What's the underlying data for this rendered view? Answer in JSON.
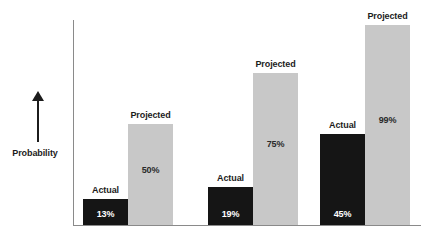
{
  "chart_data": {
    "type": "bar",
    "title": "",
    "subtitle": "",
    "xlabel": "",
    "ylabel": "Probability",
    "ylim": [
      0,
      100
    ],
    "grid": false,
    "legend": "none",
    "axis_ticks": [],
    "categories": [
      "Group 1",
      "Group 2",
      "Group 3"
    ],
    "series": [
      {
        "name": "Actual",
        "values": [
          13,
          19,
          45
        ]
      },
      {
        "name": "Projected",
        "values": [
          50,
          75,
          99
        ]
      }
    ],
    "bars": [
      {
        "group": 0,
        "series": "Actual",
        "caption": "Actual",
        "value": 13,
        "label": "13%",
        "color": "#151515"
      },
      {
        "group": 0,
        "series": "Projected",
        "caption": "Projected",
        "value": 50,
        "label": "50%",
        "color": "#c8c8c8"
      },
      {
        "group": 1,
        "series": "Actual",
        "caption": "Actual",
        "value": 19,
        "label": "19%",
        "color": "#151515"
      },
      {
        "group": 1,
        "series": "Projected",
        "caption": "Projected",
        "value": 75,
        "label": "75%",
        "color": "#c8c8c8"
      },
      {
        "group": 2,
        "series": "Actual",
        "caption": "Actual",
        "value": 45,
        "label": "45%",
        "color": "#151515"
      },
      {
        "group": 2,
        "series": "Projected",
        "caption": "Projected",
        "value": 99,
        "label": "99%",
        "color": "#c8c8c8"
      }
    ],
    "colors": {
      "actual": "#151515",
      "projected": "#c8c8c8",
      "axis": "#8a8a8a",
      "text": "#1c1c1c",
      "background": "#ffffff"
    }
  },
  "axis": {
    "y_label": "Probability",
    "arrow_icon": "up-arrow-icon"
  },
  "bar_captions": {
    "b0": "Actual",
    "b1": "Projected",
    "b2": "Actual",
    "b3": "Projected",
    "b4": "Actual",
    "b5": "Projected"
  },
  "bar_labels": {
    "b0": "13%",
    "b1": "50%",
    "b2": "19%",
    "b3": "75%",
    "b4": "45%",
    "b5": "99%"
  }
}
